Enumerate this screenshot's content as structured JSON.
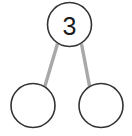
{
  "diagram": {
    "type": "number-bond",
    "background_color": "#ffffff",
    "circle_stroke_color": "#333333",
    "circle_fill_color": "#ffffff",
    "circle_stroke_width": 1.6,
    "connector_color": "#a8a8a8",
    "connector_width": 3.4,
    "text_color": "#1a1a1a",
    "nodes": [
      {
        "id": "whole",
        "role": "whole",
        "label": "3",
        "cx": 69.5,
        "cy": 24.5,
        "r": 22
      },
      {
        "id": "part-left",
        "role": "part",
        "label": "",
        "cx": 33,
        "cy": 105.5,
        "r": 22
      },
      {
        "id": "part-right",
        "role": "part",
        "label": "",
        "cx": 101,
        "cy": 105.5,
        "r": 22
      }
    ],
    "connectors": [
      {
        "id": "whole-to-left",
        "from": "whole",
        "to": "part-left",
        "x1": 57.5,
        "y1": 43.8,
        "x2": 44.8,
        "y2": 86.5
      },
      {
        "id": "whole-to-right",
        "from": "whole",
        "to": "part-right",
        "x1": 81.5,
        "y1": 43.8,
        "x2": 89.6,
        "y2": 86.5
      }
    ]
  }
}
